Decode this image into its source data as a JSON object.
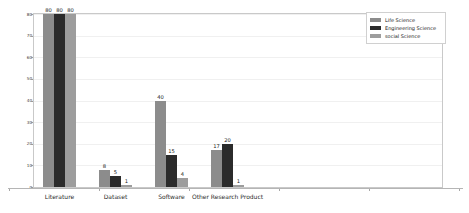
{
  "chart_data": {
    "type": "bar",
    "title": "",
    "xlabel": "",
    "ylabel": "",
    "categories": [
      "Literature",
      "Dataset",
      "Software",
      "Other Research Product"
    ],
    "series": [
      {
        "name": "Life Science",
        "color": "#8c8c8c",
        "values": [
          80,
          8,
          40,
          17
        ]
      },
      {
        "name": "Engineering Science",
        "color": "#2b2b2b",
        "values": [
          80,
          5,
          15,
          20
        ]
      },
      {
        "name": "social Science",
        "color": "#9d9d9d",
        "values": [
          80,
          1,
          4,
          1
        ]
      }
    ],
    "ylim": [
      0,
      80
    ],
    "yticks": [
      0,
      10,
      20,
      30,
      40,
      50,
      60,
      70,
      80
    ],
    "ytick_labels": [
      "0",
      "10",
      "20",
      "30",
      "40",
      "50",
      "60",
      "70",
      "80"
    ],
    "grid": true,
    "grid_axis": "y",
    "legend_position": "upper right",
    "value_labels": true
  },
  "legend": {
    "entries": [
      {
        "label": "Life Science"
      },
      {
        "label": "Engineering Science"
      },
      {
        "label": "social Science"
      }
    ]
  }
}
